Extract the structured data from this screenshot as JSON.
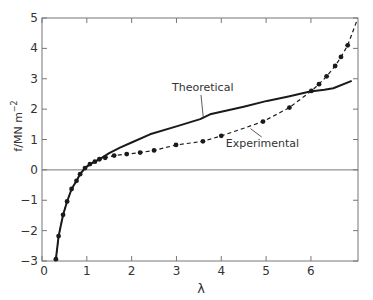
{
  "chart_data": {
    "type": "line",
    "title": "",
    "xlabel": "λ",
    "ylabel": "f/MN m⁻²",
    "ylabel_parts": {
      "main": "f/MN m",
      "sup": "−2"
    },
    "xlim": [
      0,
      7.05
    ],
    "ylim": [
      -3,
      5
    ],
    "xticks": [
      0,
      1,
      2,
      3,
      4,
      5,
      6
    ],
    "yticks": [
      -3,
      -2,
      -1,
      0,
      1,
      2,
      3,
      4,
      5
    ],
    "grid": false,
    "zero_line": true,
    "legend": "inline labels with leader lines",
    "series": [
      {
        "name": "Theoretical",
        "style": "solid",
        "markers": false,
        "x": [
          0.31,
          0.37,
          0.47,
          0.56,
          0.66,
          0.77,
          0.85,
          0.96,
          1.07,
          1.18,
          1.29,
          1.5,
          1.74,
          2.0,
          2.41,
          3.0,
          3.53,
          3.75,
          4.5,
          5.02,
          5.5,
          5.98,
          6.3,
          6.5,
          6.91
        ],
        "y": [
          -2.94,
          -2.18,
          -1.48,
          -1.04,
          -0.63,
          -0.36,
          -0.14,
          0.06,
          0.19,
          0.27,
          0.35,
          0.55,
          0.73,
          0.9,
          1.17,
          1.43,
          1.67,
          1.83,
          2.08,
          2.27,
          2.42,
          2.58,
          2.64,
          2.69,
          2.93
        ]
      },
      {
        "name": "Experimental",
        "style": "dashed",
        "markers": true,
        "x": [
          0.31,
          0.37,
          0.47,
          0.56,
          0.66,
          0.77,
          0.85,
          0.96,
          1.07,
          1.18,
          1.28,
          1.41,
          1.61,
          1.89,
          2.19,
          2.5,
          2.99,
          3.59,
          4.0,
          4.93,
          5.52,
          6.01,
          6.18,
          6.35,
          6.54,
          6.67,
          6.82
        ],
        "y": [
          -2.94,
          -2.18,
          -1.48,
          -1.04,
          -0.63,
          -0.36,
          -0.14,
          0.06,
          0.19,
          0.27,
          0.35,
          0.4,
          0.47,
          0.52,
          0.57,
          0.64,
          0.82,
          0.94,
          1.12,
          1.59,
          2.05,
          2.6,
          2.82,
          3.08,
          3.42,
          3.72,
          4.1
        ],
        "extension": {
          "x": [
            6.82,
            7.03
          ],
          "y": [
            4.1,
            4.93
          ]
        }
      }
    ],
    "annotations": [
      {
        "text": "Theoretical",
        "x": 2.9,
        "y": 2.6,
        "points_to": [
          3.6,
          1.69
        ]
      },
      {
        "text": "Experimental",
        "x": 4.1,
        "y": 0.75,
        "points_to": [
          4.65,
          1.36
        ]
      }
    ]
  }
}
